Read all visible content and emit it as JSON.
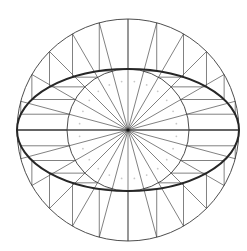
{
  "diagram": {
    "title": "",
    "type": "concentric-circle ellipse construction",
    "canvas": {
      "width": 247,
      "height": 251
    },
    "center": {
      "x": 128,
      "y": 130
    },
    "outer_circle_radius": 111,
    "inner_circle_radius": 61,
    "ellipse": {
      "rx": 111,
      "ry": 61
    },
    "radial_divisions": 24,
    "angle_step_deg": 15,
    "colors": {
      "background": "#ffffff",
      "lines": "#4a4a4a",
      "ellipse": "#262626",
      "marks": "#c8c8c8"
    },
    "labels": []
  }
}
